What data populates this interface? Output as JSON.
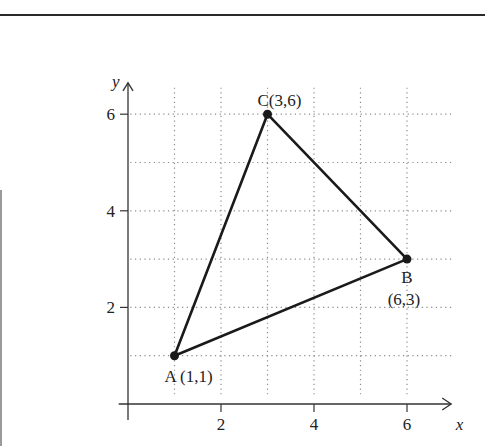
{
  "chart_data": {
    "type": "scatter",
    "title": "",
    "xlabel": "x",
    "ylabel": "y",
    "xlim": [
      0,
      7
    ],
    "ylim": [
      0,
      6.5
    ],
    "grid": true,
    "grid_step": 1,
    "x_ticks": [
      {
        "value": 2,
        "label": "2"
      },
      {
        "value": 4,
        "label": "4"
      },
      {
        "value": 6,
        "label": "6"
      }
    ],
    "y_ticks": [
      {
        "value": 2,
        "label": "2"
      },
      {
        "value": 4,
        "label": "4"
      },
      {
        "value": 6,
        "label": "6"
      }
    ],
    "points": [
      {
        "name": "A",
        "x": 1,
        "y": 1,
        "label": "A (1,1)"
      },
      {
        "name": "B",
        "x": 6,
        "y": 3,
        "label_name": "B",
        "label_coords": "(6,3)"
      },
      {
        "name": "C",
        "x": 3,
        "y": 6,
        "label": "C(3,6)"
      }
    ],
    "polygon": [
      "A",
      "B",
      "C"
    ],
    "colors": {
      "line": "#1a1a1a",
      "grid": "#8a8a8a",
      "text": "#222222"
    }
  }
}
